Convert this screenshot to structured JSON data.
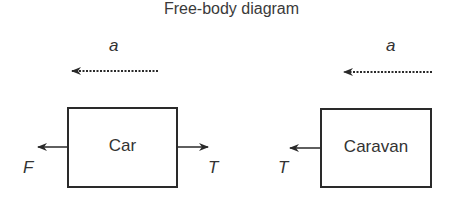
{
  "title": "Free-body diagram",
  "bodies": [
    {
      "name": "Car",
      "acceleration_label": "a",
      "forces": [
        {
          "label": "F",
          "direction": "left"
        },
        {
          "label": "T",
          "direction": "right"
        }
      ]
    },
    {
      "name": "Caravan",
      "acceleration_label": "a",
      "forces": [
        {
          "label": "T",
          "direction": "left"
        }
      ]
    }
  ],
  "colors": {
    "line": "#2a2a2a",
    "text": "#333333"
  }
}
